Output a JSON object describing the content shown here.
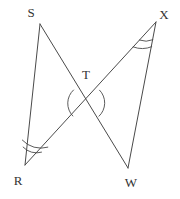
{
  "figure": {
    "canvas": {
      "width": 180,
      "height": 199,
      "background": "#ffffff"
    },
    "stroke_color": "#4a4a4a",
    "label_color": "#333333",
    "vertices": [
      {
        "id": "S",
        "label": "S",
        "x": 40,
        "y": 24,
        "label_x": 31,
        "label_y": 17
      },
      {
        "id": "X",
        "label": "X",
        "x": 156,
        "y": 22,
        "label_x": 164,
        "label_y": 19
      },
      {
        "id": "T",
        "label": "T",
        "x": 86,
        "y": 103,
        "label_x": 86,
        "label_y": 79
      },
      {
        "id": "R",
        "label": "R",
        "x": 25,
        "y": 165,
        "label_x": 18,
        "label_y": 185
      },
      {
        "id": "W",
        "label": "W",
        "x": 128,
        "y": 168,
        "label_x": 131,
        "label_y": 187
      }
    ],
    "segments": [
      {
        "id": "SR",
        "from": "S",
        "to": "R"
      },
      {
        "id": "SW",
        "from": "S",
        "to": "W"
      },
      {
        "id": "RX",
        "from": "R",
        "to": "X"
      },
      {
        "id": "XW",
        "from": "X",
        "to": "W"
      }
    ],
    "angle_marks": [
      {
        "id": "angle-R",
        "vertex": "R",
        "arcs": 2,
        "meaning": "congruent-angle-double-arc"
      },
      {
        "id": "angle-X",
        "vertex": "X",
        "arcs": 2,
        "meaning": "congruent-angle-double-arc"
      },
      {
        "id": "angle-T-left",
        "vertex": "T",
        "arcs": 1,
        "meaning": "vertical-angle-single-arc"
      },
      {
        "id": "angle-T-right",
        "vertex": "T",
        "arcs": 1,
        "meaning": "vertical-angle-single-arc"
      }
    ]
  }
}
